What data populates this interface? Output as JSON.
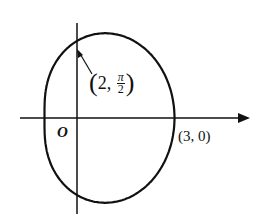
{
  "diagram": {
    "type": "polar-curve",
    "curve_description": "closed limacon-like curve r = 2 + cos(theta)",
    "origin_label": "O",
    "points": [
      {
        "id": "top",
        "label_open": "(",
        "r": "2",
        "comma": ",",
        "theta_num": "π",
        "theta_den": "2",
        "label_close": ")"
      },
      {
        "id": "right",
        "label": "(3, 0)"
      }
    ],
    "axes": {
      "x_arrow": true,
      "y_arrow": false
    },
    "colors": {
      "stroke": "#111111",
      "background": "#ffffff"
    }
  }
}
